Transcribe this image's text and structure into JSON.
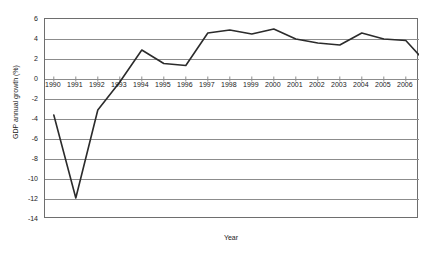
{
  "chart_data": {
    "type": "line",
    "title": "",
    "xlabel": "Year",
    "ylabel": "GDP annual growth (%)",
    "x": [
      1990,
      1991,
      1992,
      1993,
      1994,
      1995,
      1996,
      1997,
      1998,
      1999,
      2000,
      2001,
      2002,
      2003,
      2004,
      2005,
      2006
    ],
    "categories": [
      "1990",
      "1991",
      "1992",
      "1993",
      "1994",
      "1995",
      "1996",
      "1997",
      "1998",
      "1999",
      "2000",
      "2001",
      "2002",
      "2003",
      "2004",
      "2005",
      "2006"
    ],
    "values": [
      -3.6,
      -11.9,
      -3.1,
      -0.3,
      2.9,
      1.55,
      1.35,
      4.6,
      4.9,
      4.5,
      5.0,
      4.0,
      3.6,
      3.4,
      4.6,
      4.0,
      3.85
    ],
    "series": [
      {
        "name": "GDP annual growth (%)",
        "color": "#2b2b2b",
        "values": [
          -3.6,
          -11.9,
          -3.1,
          -0.3,
          2.9,
          1.55,
          1.35,
          4.6,
          4.9,
          4.5,
          5.0,
          4.0,
          3.6,
          3.4,
          4.6,
          4.0,
          3.85
        ]
      }
    ],
    "tail_point": {
      "x": 2006.6,
      "y": 2.4
    },
    "ylim": [
      -14,
      6
    ],
    "xlim": [
      1989.6,
      2006.6
    ],
    "yticks": [
      6,
      4,
      2,
      0,
      -2,
      -4,
      -6,
      -8,
      -10,
      -12,
      -14
    ],
    "ytick_labels": [
      "6",
      "4",
      "2",
      "0",
      "-2",
      "-4",
      "-6",
      "-8",
      "-10",
      "-12",
      "-14"
    ],
    "grid": "horizontal",
    "legend": "none",
    "gridline_color": "#8c8c8c",
    "frame_color": "#6e6e6e",
    "line_color": "#2b2b2b",
    "background": "#ffffff"
  }
}
